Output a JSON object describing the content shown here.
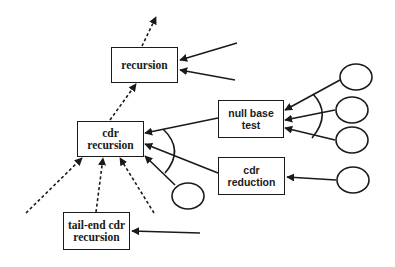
{
  "diagram": {
    "title": "",
    "colors": {
      "stroke": "#1a1a1a",
      "background": "#ffffff"
    },
    "nodes": {
      "recursion": {
        "lines": [
          "recursion"
        ]
      },
      "cdr_recursion": {
        "lines": [
          "cdr",
          "recursion"
        ]
      },
      "null_base_test": {
        "lines": [
          "null base",
          "test"
        ]
      },
      "cdr_reduction": {
        "lines": [
          "cdr",
          "reduction"
        ]
      },
      "tail_end_cdr_recursion": {
        "lines": [
          "tail-end cdr",
          "recursion"
        ]
      }
    },
    "unlabeled_ellipses": 5,
    "edges": [
      {
        "from": "recursion",
        "to": "above",
        "style": "dashed"
      },
      {
        "from": "cdr_recursion",
        "to": "recursion",
        "style": "dashed"
      },
      {
        "from": "external_1",
        "to": "recursion",
        "style": "solid"
      },
      {
        "from": "external_2",
        "to": "recursion",
        "style": "solid"
      },
      {
        "from": "null_base_test",
        "to": "cdr_recursion",
        "style": "solid",
        "group": "and-arc"
      },
      {
        "from": "cdr_reduction",
        "to": "cdr_recursion",
        "style": "solid",
        "group": "and-arc"
      },
      {
        "from": "ellipse_low",
        "to": "cdr_recursion",
        "style": "solid",
        "group": "and-arc"
      },
      {
        "from": "ellipse_1",
        "to": "null_base_test",
        "style": "solid",
        "group": "and-arc"
      },
      {
        "from": "ellipse_2",
        "to": "null_base_test",
        "style": "solid",
        "group": "and-arc"
      },
      {
        "from": "ellipse_3",
        "to": "null_base_test",
        "style": "solid",
        "group": "and-arc"
      },
      {
        "from": "ellipse_4",
        "to": "cdr_reduction",
        "style": "solid"
      },
      {
        "from": "lower_left",
        "to": "cdr_recursion",
        "style": "dashed"
      },
      {
        "from": "tail_end_cdr_recursion",
        "to": "cdr_recursion",
        "style": "dashed"
      },
      {
        "from": "lower_right",
        "to": "cdr_recursion",
        "style": "dashed"
      },
      {
        "from": "external_3",
        "to": "tail_end_cdr_recursion",
        "style": "solid"
      }
    ]
  }
}
